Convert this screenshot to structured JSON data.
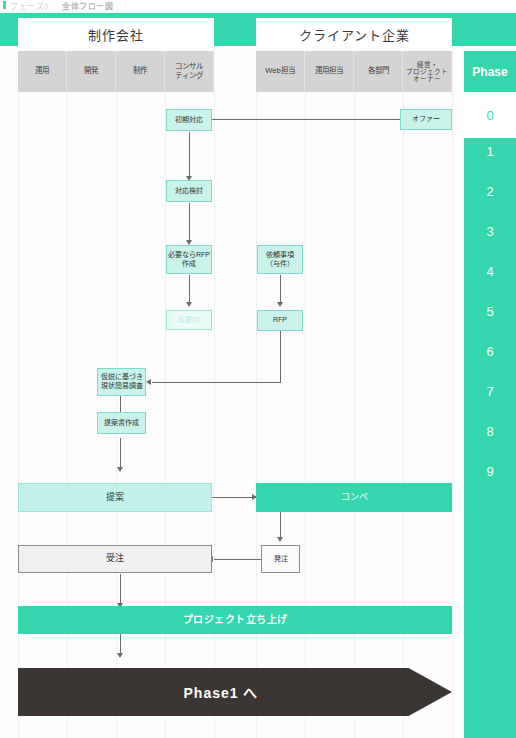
{
  "top_fragment": {
    "left_text": "フェーズ0",
    "right_text": "全体フロー図"
  },
  "header": {
    "groups": [
      {
        "label": "制作会社"
      },
      {
        "label": "クライアント企業"
      }
    ],
    "left_columns": [
      {
        "label": "運用"
      },
      {
        "label": "開発"
      },
      {
        "label": "制作"
      },
      {
        "label": "コンサル\nティング"
      }
    ],
    "right_columns": [
      {
        "label": "Web担当"
      },
      {
        "label": "運用担当"
      },
      {
        "label": "各部門"
      },
      {
        "label": "経営・\nプロジェクト\nオーナー"
      }
    ],
    "phase_label": "Phase"
  },
  "phase_column": {
    "current": "0",
    "numbers": [
      "1",
      "2",
      "3",
      "4",
      "5",
      "6",
      "7",
      "8",
      "9"
    ],
    "accent_color": "#33d6ad",
    "current_text_color": "#33d6ad"
  },
  "nodes": {
    "offer": "オファー",
    "initial_response": "初期対応",
    "response_review": "対応検討",
    "rfp_if_needed": "必要ならRFP\n作成",
    "provisional": "仮提01",
    "request_items": "依頼事項\n（与件）",
    "rfp": "RFP",
    "survey": "仮説に基づき\n現状簡易調査",
    "proposal_doc": "提案書作成",
    "proposal": "提案",
    "compe": "コンペ",
    "order_received": "受注",
    "order_placed": "発注",
    "project_kickoff": "プロジェクト立ち上げ",
    "next_phase": "Phase1 へ"
  },
  "colors": {
    "accent_teal": "#33d6ad",
    "light_teal": "#c9f2ea",
    "pale_teal": "#e9fbf7",
    "gray_header": "#d4d4d4",
    "dark_banner": "#3b3633",
    "gray_box": "#f0f0f0"
  }
}
